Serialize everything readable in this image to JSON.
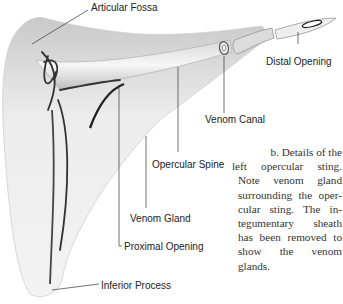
{
  "figure": {
    "labels": {
      "articular_fossa": "Articular Fossa",
      "distal_opening": "Distal Opening",
      "venom_canal": "Venom Canal",
      "opercular_spine": "Opercular Spine",
      "venom_gland": "Venom Gland",
      "proximal_opening": "Proximal Opening",
      "inferior_process": "Inferior Process"
    },
    "caption_lines": [
      "b. Details of the",
      "left opercular sting.",
      "Note venom gland",
      "surrounding the oper-",
      "cular sting. The in-",
      "tegumentary sheath",
      "has been removed to",
      "show the venom",
      "glands."
    ]
  }
}
